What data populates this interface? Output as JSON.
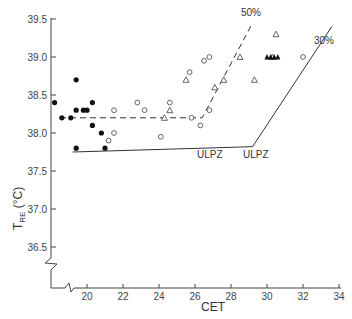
{
  "chart_data": {
    "type": "scatter",
    "title": "",
    "xlabel": "CET",
    "ylabel": "T_RE (°C)",
    "ylabel_main": "T",
    "ylabel_sub": "RE",
    "ylabel_unit": "(°C)",
    "xlim": [
      18.5,
      34
    ],
    "ylim": [
      36.2,
      39.5
    ],
    "grid": false,
    "legend": null,
    "x_ticks": [
      20,
      22,
      24,
      26,
      28,
      30,
      32,
      34
    ],
    "x_tick_labels": [
      "20",
      "22",
      "24",
      "26",
      "28",
      "30",
      "32",
      "34"
    ],
    "y_ticks": [
      36.5,
      37.0,
      37.5,
      38.0,
      38.5,
      39.0,
      39.5
    ],
    "y_tick_labels": [
      "36.5",
      "37.0",
      "37.5",
      "38.0",
      "38.5",
      "39.0",
      "39.5"
    ],
    "axis_breaks": [
      "x-axis break near origin",
      "y-axis break near origin"
    ],
    "series": [
      {
        "name": "filled circles",
        "marker": "filled-circle",
        "points": [
          [
            18.2,
            38.4
          ],
          [
            18.6,
            38.2
          ],
          [
            19.1,
            38.2
          ],
          [
            19.4,
            38.7
          ],
          [
            19.4,
            38.3
          ],
          [
            19.8,
            38.3
          ],
          [
            20.0,
            38.3
          ],
          [
            20.3,
            38.4
          ],
          [
            20.3,
            38.1
          ],
          [
            20.8,
            38.0
          ],
          [
            21.0,
            37.8
          ],
          [
            19.4,
            37.8
          ]
        ]
      },
      {
        "name": "open circles",
        "marker": "open-circle",
        "points": [
          [
            21.5,
            38.3
          ],
          [
            21.5,
            38.0
          ],
          [
            21.2,
            37.9
          ],
          [
            22.8,
            38.4
          ],
          [
            23.2,
            38.3
          ],
          [
            24.1,
            37.95
          ],
          [
            24.6,
            38.4
          ],
          [
            25.8,
            38.2
          ],
          [
            25.7,
            38.8
          ],
          [
            26.5,
            38.95
          ],
          [
            26.8,
            39.0
          ],
          [
            26.8,
            38.3
          ],
          [
            26.3,
            38.1
          ],
          [
            32.0,
            39.0
          ]
        ]
      },
      {
        "name": "open triangles",
        "marker": "open-triangle",
        "points": [
          [
            24.3,
            38.2
          ],
          [
            24.6,
            38.3
          ],
          [
            25.5,
            38.7
          ],
          [
            27.1,
            38.6
          ],
          [
            27.6,
            38.7
          ],
          [
            28.5,
            39.0
          ],
          [
            29.3,
            38.7
          ],
          [
            30.5,
            39.3
          ],
          [
            30.3,
            39.0
          ]
        ]
      },
      {
        "name": "filled triangles",
        "marker": "filled-triangle",
        "points": [
          [
            30.0,
            39.0
          ],
          [
            30.2,
            39.0
          ],
          [
            30.4,
            39.0
          ],
          [
            30.6,
            39.0
          ]
        ]
      }
    ],
    "lines": [
      {
        "name": "50% ULPZ",
        "style": "dashed",
        "points": [
          [
            18.5,
            38.2
          ],
          [
            26.4,
            38.2
          ],
          [
            29.2,
            39.45
          ]
        ]
      },
      {
        "name": "30% ULPZ",
        "style": "solid",
        "points": [
          [
            19.2,
            37.75
          ],
          [
            29.2,
            37.82
          ],
          [
            33.6,
            39.4
          ]
        ]
      }
    ],
    "annotations": [
      {
        "text": "50%",
        "x": 29.3,
        "y": 39.55
      },
      {
        "text": "30%",
        "x": 33.4,
        "y": 39.35
      },
      {
        "text": "ULPZ",
        "x": 26.0,
        "y": 38.07
      },
      {
        "text": "ULPZ",
        "x": 29.4,
        "y": 37.67
      }
    ]
  },
  "labels": {
    "x_axis_title": "CET",
    "y_axis_main": "T",
    "y_axis_sub": "RE",
    "y_axis_unit": " (°C)",
    "annot_50": "50%",
    "annot_30": "30%",
    "annot_ulpz_dashed": "ULPZ",
    "annot_ulpz_solid": "ULPZ"
  },
  "colors": {
    "ink": "#333333",
    "background": "#ffffff"
  }
}
